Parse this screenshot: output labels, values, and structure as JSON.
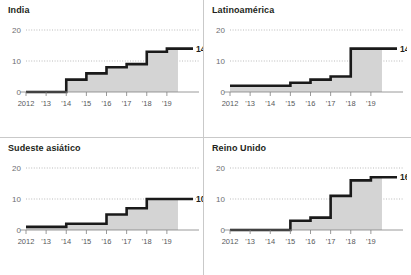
{
  "figure": {
    "panel_count": 4,
    "accent_color": "#1a1a1a",
    "area_color": "#d4d4d4",
    "gridline_color": "#9d9d9d",
    "axis_color": "#808080",
    "background": "#ffffff"
  },
  "chart_data": [
    {
      "type": "line",
      "title": "India",
      "xlabel": "",
      "ylabel": "",
      "x": [
        2012,
        2013,
        2014,
        2015,
        2016,
        2017,
        2018,
        2019
      ],
      "tick_labels": [
        "2012",
        "'13",
        "'14",
        "'15",
        "'16",
        "'17",
        "'18",
        "'19"
      ],
      "values": [
        0,
        0,
        4,
        6,
        8,
        9,
        13,
        14
      ],
      "end_label": "14",
      "ylim": [
        0,
        20
      ],
      "yticks": [
        0,
        10,
        20
      ],
      "ytick_labels": [
        "0",
        "10",
        "20"
      ],
      "grid": true,
      "legend": "none",
      "step": "post",
      "filled": true
    },
    {
      "type": "line",
      "title": "Latinoamérica",
      "xlabel": "",
      "ylabel": "",
      "x": [
        2012,
        2013,
        2014,
        2015,
        2016,
        2017,
        2018,
        2019
      ],
      "tick_labels": [
        "2012",
        "'13",
        "'14",
        "'15",
        "'16",
        "'17",
        "'18",
        "'19"
      ],
      "values": [
        2,
        2,
        2,
        3,
        4,
        5,
        14,
        14
      ],
      "end_label": "14",
      "ylim": [
        0,
        20
      ],
      "yticks": [
        0,
        10,
        20
      ],
      "ytick_labels": [
        "0",
        "10",
        "20"
      ],
      "grid": true,
      "legend": "none",
      "step": "post",
      "filled": true
    },
    {
      "type": "line",
      "title": "Sudeste asiático",
      "xlabel": "",
      "ylabel": "",
      "x": [
        2012,
        2013,
        2014,
        2015,
        2016,
        2017,
        2018,
        2019
      ],
      "tick_labels": [
        "2012",
        "'13",
        "'14",
        "'15",
        "'16",
        "'17",
        "'18",
        "'19"
      ],
      "values": [
        1,
        1,
        2,
        2,
        5,
        7,
        10,
        10
      ],
      "end_label": "10",
      "ylim": [
        0,
        20
      ],
      "yticks": [
        0,
        10,
        20
      ],
      "ytick_labels": [
        "0",
        "10",
        "20"
      ],
      "grid": true,
      "legend": "none",
      "step": "post",
      "filled": true
    },
    {
      "type": "line",
      "title": "Reino Unido",
      "xlabel": "",
      "ylabel": "",
      "x": [
        2012,
        2013,
        2014,
        2015,
        2016,
        2017,
        2018,
        2019
      ],
      "tick_labels": [
        "2012",
        "'13",
        "'14",
        "'15",
        "'16",
        "'17",
        "'18",
        "'19"
      ],
      "values": [
        0,
        0,
        0,
        3,
        4,
        11,
        16,
        17
      ],
      "end_label": "16",
      "ylim": [
        0,
        20
      ],
      "yticks": [
        0,
        10,
        20
      ],
      "ytick_labels": [
        "0",
        "10",
        "20"
      ],
      "grid": true,
      "legend": "none",
      "step": "post",
      "filled": true
    }
  ]
}
